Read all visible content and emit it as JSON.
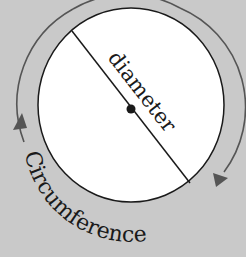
{
  "diagram": {
    "labels": {
      "diameter": "diameter",
      "circumference": "Circumference"
    },
    "colors": {
      "background": "#c9c9c9",
      "circle_fill": "#ffffff",
      "outline": "#1a1a1a",
      "arrow": "#555555"
    },
    "elements": [
      "circle",
      "diameter-line",
      "center-point",
      "circumference-arrows"
    ]
  }
}
